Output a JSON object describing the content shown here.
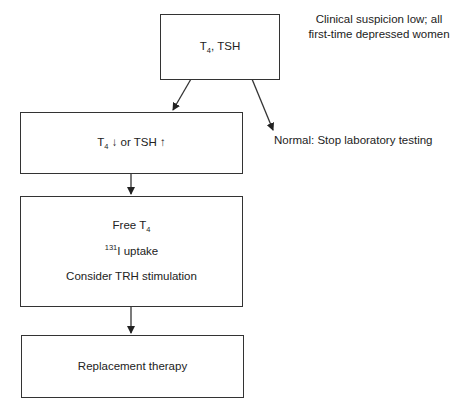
{
  "diagram": {
    "nodes": [
      {
        "id": "start",
        "label_main": "T",
        "label_sub": "4",
        "label_rest": ", TSH"
      },
      {
        "id": "abnormal",
        "label_main": "T",
        "label_sub": "4",
        "label_arrow_down": " ↓ ",
        "label_rest": "or TSH ",
        "label_arrow_up": "↑"
      },
      {
        "id": "workup",
        "lines": [
          {
            "text": "Free T",
            "sub": "4"
          },
          {
            "sup": "131",
            "text": "I uptake"
          },
          {
            "text": "Consider TRH stimulation"
          }
        ]
      },
      {
        "id": "treatment",
        "label": "Replacement therapy"
      }
    ],
    "annotations": {
      "criteria_line1": "Clinical suspicion low; all",
      "criteria_line2": "first-time depressed women",
      "normal_outcome": "Normal: Stop laboratory testing"
    },
    "edges": [
      {
        "from": "start",
        "to": "abnormal"
      },
      {
        "from": "start",
        "to": "normal_outcome"
      },
      {
        "from": "abnormal",
        "to": "workup"
      },
      {
        "from": "workup",
        "to": "treatment"
      }
    ],
    "colors": {
      "line": "#333333",
      "background": "#ffffff",
      "text": "#222222"
    }
  }
}
